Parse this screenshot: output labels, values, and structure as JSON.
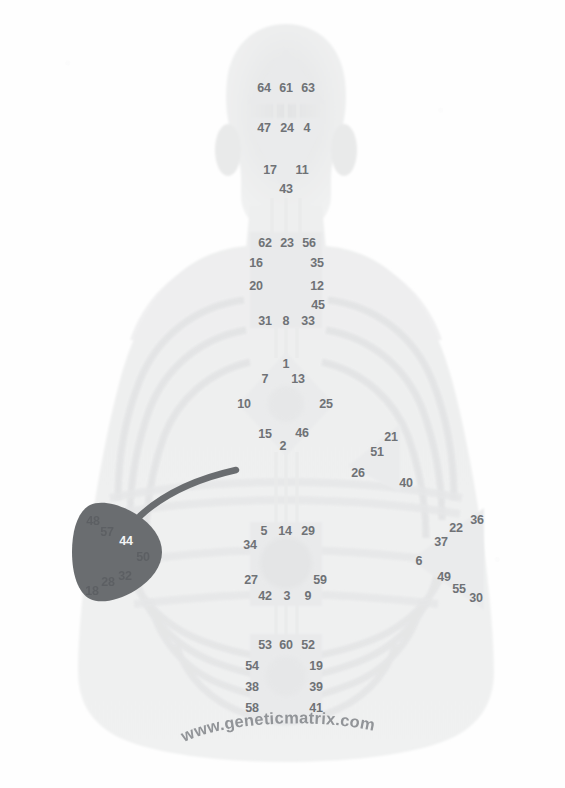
{
  "image": {
    "title": "Human Design BodyGraph over body silhouette",
    "watermark": "www.geneticmatrix.com"
  },
  "colors": {
    "background": "#ffffff",
    "silhouette": "#eceded",
    "silhouette_edge": "#e3e4e5",
    "center_fill": "#e7e8e9",
    "channel": "#ededee",
    "gate_text": "#6f7276",
    "highlight_fill": "#6a6d70",
    "highlight_text": "#f4f5f6",
    "pointer_line": "#6a6d70",
    "watermark_text": "#8d9094"
  },
  "highlight": {
    "center": "spleen",
    "label": "44",
    "note": "spleen center shaded dark with curved pointer line"
  },
  "centers": [
    {
      "name": "head",
      "shape": "triangle-up",
      "gates": [
        {
          "number": "64",
          "x": 264,
          "y": 88
        },
        {
          "number": "61",
          "x": 286,
          "y": 88
        },
        {
          "number": "63",
          "x": 308,
          "y": 88
        }
      ]
    },
    {
      "name": "ajna",
      "shape": "triangle-down",
      "gates": [
        {
          "number": "47",
          "x": 264,
          "y": 128
        },
        {
          "number": "24",
          "x": 287,
          "y": 128
        },
        {
          "number": "4",
          "x": 307,
          "y": 128
        },
        {
          "number": "17",
          "x": 270,
          "y": 170
        },
        {
          "number": "11",
          "x": 302,
          "y": 170
        },
        {
          "number": "43",
          "x": 286,
          "y": 189
        }
      ]
    },
    {
      "name": "throat",
      "shape": "square",
      "gates": [
        {
          "number": "62",
          "x": 265,
          "y": 243
        },
        {
          "number": "23",
          "x": 287,
          "y": 243
        },
        {
          "number": "56",
          "x": 309,
          "y": 243
        },
        {
          "number": "16",
          "x": 256,
          "y": 263
        },
        {
          "number": "35",
          "x": 317,
          "y": 263
        },
        {
          "number": "20",
          "x": 256,
          "y": 286
        },
        {
          "number": "12",
          "x": 317,
          "y": 286
        },
        {
          "number": "45",
          "x": 318,
          "y": 305
        },
        {
          "number": "31",
          "x": 265,
          "y": 321
        },
        {
          "number": "8",
          "x": 286,
          "y": 321
        },
        {
          "number": "33",
          "x": 308,
          "y": 321
        }
      ]
    },
    {
      "name": "g-center",
      "shape": "diamond",
      "gates": [
        {
          "number": "1",
          "x": 286,
          "y": 364
        },
        {
          "number": "7",
          "x": 265,
          "y": 379
        },
        {
          "number": "13",
          "x": 298,
          "y": 379
        },
        {
          "number": "10",
          "x": 244,
          "y": 404
        },
        {
          "number": "25",
          "x": 326,
          "y": 404
        },
        {
          "number": "15",
          "x": 265,
          "y": 434
        },
        {
          "number": "46",
          "x": 302,
          "y": 433
        },
        {
          "number": "2",
          "x": 283,
          "y": 446
        }
      ]
    },
    {
      "name": "heart",
      "shape": "triangle-left",
      "gates": [
        {
          "number": "21",
          "x": 391,
          "y": 437
        },
        {
          "number": "51",
          "x": 377,
          "y": 452
        },
        {
          "number": "26",
          "x": 358,
          "y": 473
        },
        {
          "number": "40",
          "x": 406,
          "y": 483
        }
      ]
    },
    {
      "name": "spleen",
      "shape": "triangle-right",
      "highlighted": true,
      "gates": [
        {
          "number": "48",
          "x": 93,
          "y": 521,
          "on_dark": true,
          "dim": true
        },
        {
          "number": "57",
          "x": 107,
          "y": 532,
          "on_dark": true,
          "dim": true
        },
        {
          "number": "44",
          "x": 126,
          "y": 541,
          "on_dark": true,
          "white": true
        },
        {
          "number": "50",
          "x": 143,
          "y": 557,
          "on_dark": true,
          "dim": true
        },
        {
          "number": "32",
          "x": 125,
          "y": 576,
          "on_dark": true,
          "dim": true
        },
        {
          "number": "28",
          "x": 108,
          "y": 582,
          "on_dark": true,
          "dim": true
        },
        {
          "number": "18",
          "x": 92,
          "y": 591,
          "on_dark": true,
          "dim": true
        }
      ]
    },
    {
      "name": "solar-plexus",
      "shape": "triangle-right",
      "gates": [
        {
          "number": "36",
          "x": 477,
          "y": 520
        },
        {
          "number": "22",
          "x": 456,
          "y": 528
        },
        {
          "number": "37",
          "x": 441,
          "y": 542
        },
        {
          "number": "6",
          "x": 419,
          "y": 561
        },
        {
          "number": "49",
          "x": 444,
          "y": 577
        },
        {
          "number": "55",
          "x": 459,
          "y": 589
        },
        {
          "number": "30",
          "x": 476,
          "y": 598
        }
      ]
    },
    {
      "name": "sacral",
      "shape": "square",
      "gates": [
        {
          "number": "5",
          "x": 264,
          "y": 531
        },
        {
          "number": "14",
          "x": 285,
          "y": 531
        },
        {
          "number": "29",
          "x": 308,
          "y": 531
        },
        {
          "number": "34",
          "x": 250,
          "y": 545
        },
        {
          "number": "27",
          "x": 251,
          "y": 580
        },
        {
          "number": "59",
          "x": 320,
          "y": 580
        },
        {
          "number": "42",
          "x": 265,
          "y": 596
        },
        {
          "number": "3",
          "x": 287,
          "y": 596
        },
        {
          "number": "9",
          "x": 308,
          "y": 596
        }
      ]
    },
    {
      "name": "root",
      "shape": "square",
      "gates": [
        {
          "number": "53",
          "x": 265,
          "y": 645
        },
        {
          "number": "60",
          "x": 286,
          "y": 645
        },
        {
          "number": "52",
          "x": 308,
          "y": 645
        },
        {
          "number": "54",
          "x": 252,
          "y": 666
        },
        {
          "number": "19",
          "x": 316,
          "y": 666
        },
        {
          "number": "38",
          "x": 252,
          "y": 687
        },
        {
          "number": "39",
          "x": 316,
          "y": 687
        },
        {
          "number": "58",
          "x": 252,
          "y": 708
        },
        {
          "number": "41",
          "x": 316,
          "y": 708
        }
      ]
    }
  ]
}
